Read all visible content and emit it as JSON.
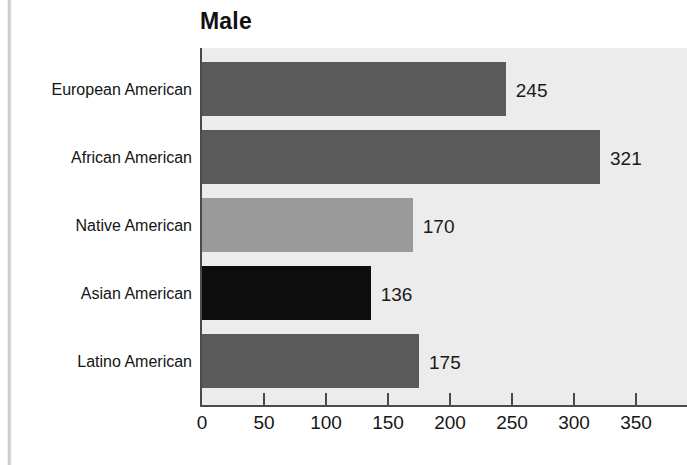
{
  "chart_data": {
    "type": "bar",
    "orientation": "horizontal",
    "title": "Male",
    "xlabel": "",
    "ylabel": "",
    "categories": [
      "European American",
      "African American",
      "Native American",
      "Asian American",
      "Latino American"
    ],
    "values": [
      245,
      321,
      170,
      136,
      175
    ],
    "value_labels": [
      "245",
      "321",
      "170",
      "136",
      "175"
    ],
    "bar_colors": [
      "#5a5a5a",
      "#5a5a5a",
      "#9a9a9a",
      "#0d0d0d",
      "#5a5a5a"
    ],
    "xlim": [
      0,
      350
    ],
    "xticks": [
      0,
      50,
      100,
      150,
      200,
      250,
      300,
      350
    ],
    "xtick_labels": [
      "0",
      "50",
      "100",
      "150",
      "200",
      "250",
      "300",
      "350"
    ],
    "grid": false,
    "legend": null,
    "plot_background": "#ececec",
    "figure_background": "#ffffff"
  }
}
